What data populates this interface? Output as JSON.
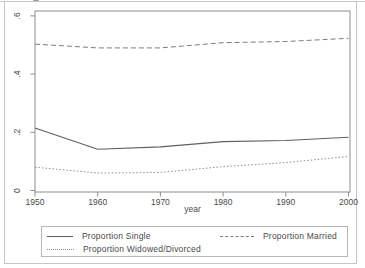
{
  "window": {
    "background": "#ffffff",
    "frame_color": "#c6c6c6"
  },
  "chart_data": {
    "type": "line",
    "title": "",
    "xlabel": "year",
    "ylabel": "",
    "x": [
      1950,
      1960,
      1970,
      1980,
      1990,
      2000
    ],
    "x_ticks": [
      "1950",
      "1960",
      "1970",
      "1980",
      "1990",
      "2000"
    ],
    "y_ticks": [
      "0",
      ".2",
      ".4",
      ".6"
    ],
    "y_tick_values": [
      0,
      0.2,
      0.4,
      0.6
    ],
    "xlim": [
      1950,
      2000
    ],
    "ylim": [
      0,
      0.62
    ],
    "grid": false,
    "legend_position": "bottom",
    "plot_border_color": "#8d8d8d",
    "text_color": "#4a4a4a",
    "series": [
      {
        "name": "Proportion Single",
        "dash": "solid",
        "color": "#5f5f5f",
        "values": [
          0.215,
          0.142,
          0.15,
          0.168,
          0.172,
          0.183
        ]
      },
      {
        "name": "Proportion Married",
        "dash": "dashed",
        "color": "#7b7b7b",
        "values": [
          0.503,
          0.49,
          0.49,
          0.508,
          0.512,
          0.523
        ]
      },
      {
        "name": "Proportion Widowed/Divorced",
        "dash": "dotted",
        "color": "#8f8f8f",
        "values": [
          0.08,
          0.06,
          0.062,
          0.082,
          0.096,
          0.117
        ]
      }
    ]
  }
}
